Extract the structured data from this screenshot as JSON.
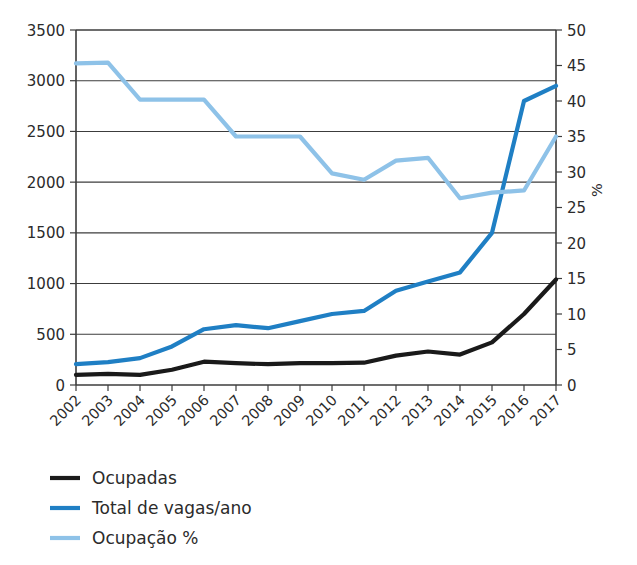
{
  "chart_data": {
    "type": "line",
    "title": "",
    "xlabel": "",
    "ylabel": "",
    "y2label": "%",
    "grid": true,
    "legend_position": "bottom-left",
    "categories": [
      "2002",
      "2003",
      "2004",
      "2005",
      "2006",
      "2007",
      "2008",
      "2009",
      "2010",
      "2011",
      "2012",
      "2013",
      "2014",
      "2015",
      "2016",
      "2017"
    ],
    "ylim": [
      0,
      3500
    ],
    "y_ticks": [
      0,
      500,
      1000,
      1500,
      2000,
      2500,
      3000,
      3500
    ],
    "y2lim": [
      0,
      50
    ],
    "y2_ticks": [
      0,
      5,
      10,
      15,
      20,
      25,
      30,
      35,
      40,
      45,
      50
    ],
    "series": [
      {
        "name": "Ocupadas",
        "color": "#1a1a1a",
        "axis": "left",
        "values": [
          100,
          110,
          100,
          150,
          230,
          215,
          205,
          215,
          215,
          220,
          290,
          330,
          300,
          420,
          700,
          1040
        ]
      },
      {
        "name": "Total de vagas/ano",
        "color": "#1f7fc4",
        "axis": "left",
        "values": [
          205,
          225,
          265,
          380,
          550,
          590,
          560,
          630,
          700,
          730,
          930,
          1020,
          1110,
          1500,
          2800,
          2950
        ]
      },
      {
        "name": "Ocupação %",
        "color": "#8ec2e8",
        "axis": "right",
        "values": [
          45.3,
          45.4,
          40.2,
          40.2,
          40.2,
          35.0,
          35.0,
          35.0,
          29.8,
          28.9,
          31.6,
          32.0,
          26.3,
          27.1,
          27.4,
          35.0
        ]
      }
    ]
  },
  "axes": {
    "left_ticks": [
      "3500",
      "3000",
      "2500",
      "2000",
      "1500",
      "1000",
      "500",
      "0"
    ],
    "right_ticks": [
      "50",
      "45",
      "40",
      "35",
      "30",
      "25",
      "20",
      "15",
      "10",
      "5",
      "0"
    ],
    "right_axis_title": "%",
    "category_labels": [
      "2002",
      "2003",
      "2004",
      "2005",
      "2006",
      "2007",
      "2008",
      "2009",
      "2010",
      "2011",
      "2012",
      "2013",
      "2014",
      "2015",
      "2016",
      "2017"
    ]
  },
  "legend": {
    "items": [
      {
        "label": "Ocupadas",
        "color": "#1a1a1a"
      },
      {
        "label": "Total de vagas/ano",
        "color": "#1f7fc4"
      },
      {
        "label": "Ocupação %",
        "color": "#8ec2e8"
      }
    ]
  }
}
